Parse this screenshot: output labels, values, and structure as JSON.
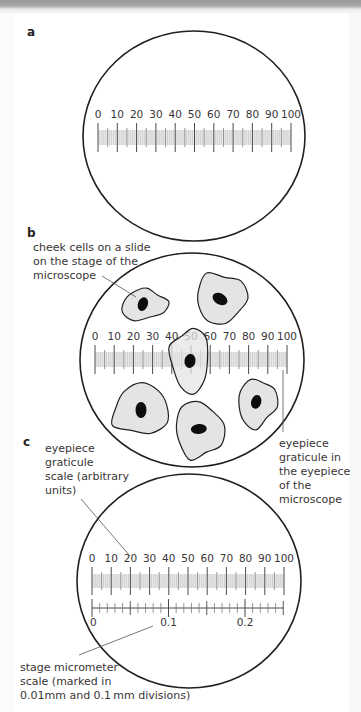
{
  "colors": {
    "outline": "#231f20",
    "cell_fill": "#e4e4e4",
    "nucleus": "#0d0d0d",
    "minor_tick": "#bdbdbd",
    "major_tick": "#4a4a4a",
    "pointer_line": "#555555",
    "text": "#3a3536"
  },
  "panels": {
    "a": {
      "letter": "a",
      "field": {
        "cx": 194,
        "cy": 136,
        "rx": 111,
        "ry": 105
      },
      "graticule": {
        "x0": 98,
        "x1": 291,
        "label_y": 118,
        "tick_top": 123,
        "tick_bottom": 152
      }
    },
    "b": {
      "letter": "b",
      "caption_lines": [
        "cheek cells on a slide",
        "on the stage of the",
        "microscope"
      ],
      "right_caption_lines": [
        "eyepiece",
        "graticule in",
        "the eyepiece",
        "of the",
        "microscope"
      ],
      "field": {
        "cx": 192,
        "cy": 360,
        "rx": 112,
        "ry": 107
      },
      "graticule": {
        "x0": 95,
        "x1": 287,
        "label_y": 340,
        "tick_top": 345,
        "tick_bottom": 374
      },
      "cells": [
        {
          "name": "cheek-cell-1",
          "cx": 144,
          "cy": 305,
          "rx": 23,
          "ry": 15,
          "rot": -8,
          "ncx": 143,
          "ncy": 304,
          "nrx": 5,
          "nry": 7,
          "nrot": 20
        },
        {
          "name": "cheek-cell-2",
          "cx": 221,
          "cy": 298,
          "rx": 25,
          "ry": 25,
          "rot": 0,
          "ncx": 220,
          "ncy": 299,
          "nrx": 8,
          "nry": 5.5,
          "nrot": 30
        },
        {
          "name": "cheek-cell-3",
          "cx": 190,
          "cy": 360,
          "rx": 19,
          "ry": 32,
          "rot": 0,
          "ncx": 190,
          "ncy": 361,
          "nrx": 5.5,
          "nry": 7,
          "nrot": 10
        },
        {
          "name": "cheek-cell-4",
          "cx": 141,
          "cy": 410,
          "rx": 28,
          "ry": 25,
          "rot": -10,
          "ncx": 141,
          "ncy": 410,
          "nrx": 5.5,
          "nry": 8,
          "nrot": 0
        },
        {
          "name": "cheek-cell-5",
          "cx": 199,
          "cy": 430,
          "rx": 24,
          "ry": 28,
          "rot": -10,
          "ncx": 199,
          "ncy": 429,
          "nrx": 8,
          "nry": 5,
          "nrot": -5
        },
        {
          "name": "cheek-cell-6",
          "cx": 257,
          "cy": 403,
          "rx": 19,
          "ry": 24,
          "rot": 10,
          "ncx": 256,
          "ncy": 402,
          "nrx": 5,
          "nry": 7,
          "nrot": 15
        }
      ],
      "pointer_cells": {
        "x1": 102,
        "y1": 276,
        "x2": 136,
        "y2": 297
      },
      "pointer_graticule": {
        "x1": 283,
        "y1": 370,
        "x2": 283,
        "y2": 432
      }
    },
    "c": {
      "letter": "c",
      "caption_lines": [
        "eyepiece",
        "graticule",
        "scale (arbitrary",
        "units)"
      ],
      "bottom_caption_lines": [
        "stage micrometer",
        "scale (marked in",
        "0.01mm and 0.1 mm divisions)"
      ],
      "field": {
        "cx": 189,
        "cy": 581,
        "rx": 112,
        "ry": 107
      },
      "graticule": {
        "x0": 92,
        "x1": 284,
        "label_y": 562,
        "tick_top": 567,
        "tick_bottom": 595
      },
      "micrometer": {
        "x0": 92,
        "unit_px": 76.5,
        "x_end": 284,
        "line_y": 608,
        "labels": [
          "0",
          "0.1",
          "0.2"
        ],
        "label_y": 626
      },
      "pointer_graticule": {
        "x1": 81,
        "y1": 499,
        "x2": 130,
        "y2": 556
      },
      "pointer_micrometer": {
        "x1": 79,
        "y1": 655,
        "x2": 153,
        "y2": 626
      }
    }
  },
  "scale_labels": [
    "0",
    "10",
    "20",
    "30",
    "40",
    "50",
    "60",
    "70",
    "80",
    "90",
    "100"
  ]
}
